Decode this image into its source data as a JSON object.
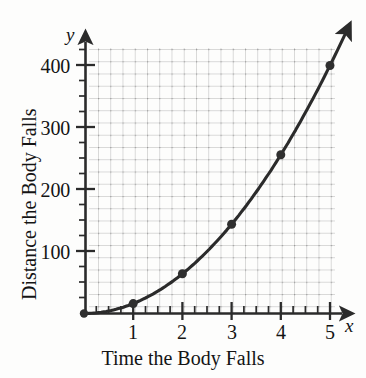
{
  "figure": {
    "background_color": "#fdfdfc",
    "ink_color": "#2b2b2b",
    "grid_color": "#b9b9b9"
  },
  "axes": {
    "x_axis_letter": "x",
    "y_axis_letter": "y",
    "x_title": "Time the Body Falls",
    "y_title": "Distance the Body Falls",
    "x_ticks": [
      "1",
      "2",
      "3",
      "4",
      "5"
    ],
    "y_ticks": [
      "100",
      "200",
      "300",
      "400"
    ]
  },
  "chart_data": {
    "type": "line",
    "title": "",
    "subtitle": "",
    "xlabel": "Time the Body Falls",
    "ylabel": "Distance the Body Falls",
    "x_axis_symbol": "x",
    "y_axis_symbol": "y",
    "xlim": [
      0,
      5.5
    ],
    "ylim": [
      0,
      440
    ],
    "x_major_ticks": [
      1,
      2,
      3,
      4,
      5
    ],
    "y_major_ticks": [
      100,
      200,
      300,
      400
    ],
    "x_minor_tick_step": 0.25,
    "y_minor_tick_step": 25,
    "grid": true,
    "grid_style": "dotted",
    "legend": false,
    "legend_position": "none",
    "marker": "filled-diamond",
    "curve_equation": "d = 16t^2",
    "series": [
      {
        "name": "Distance the Body Falls",
        "x": [
          0,
          1,
          2,
          3,
          4,
          5
        ],
        "values": [
          0,
          16,
          64,
          144,
          256,
          400
        ]
      }
    ],
    "annotations": []
  }
}
